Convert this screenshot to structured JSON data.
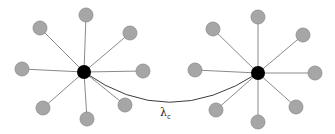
{
  "diagram": {
    "type": "two-star-network",
    "link_label": {
      "symbol": "λ",
      "subscript": "c",
      "x": 160,
      "y": 116
    },
    "link_curve": {
      "from": [
        84,
        72
      ],
      "control": [
        168,
        132
      ],
      "to": [
        258,
        73
      ]
    },
    "colors": {
      "hub": "#000000",
      "leaf_fill": "#a6a6a6",
      "leaf_stroke": "#8c8c8c",
      "edge": "#8a8a8a",
      "link": "#3c3c3c"
    },
    "hub_radius": 7,
    "leaf_radius": 7,
    "stars": [
      {
        "name": "left-star",
        "hub": [
          84,
          72
        ],
        "leaves": [
          [
            86,
            15
          ],
          [
            40,
            28
          ],
          [
            130,
            33
          ],
          [
            22,
            69
          ],
          [
            143,
            71
          ],
          [
            43,
            108
          ],
          [
            125,
            105
          ],
          [
            87,
            119
          ]
        ]
      },
      {
        "name": "right-star",
        "hub": [
          258,
          73
        ],
        "leaves": [
          [
            258,
            17
          ],
          [
            213,
            29
          ],
          [
            303,
            35
          ],
          [
            195,
            70
          ],
          [
            315,
            73
          ],
          [
            216,
            110
          ],
          [
            296,
            107
          ],
          [
            258,
            122
          ]
        ]
      }
    ]
  }
}
